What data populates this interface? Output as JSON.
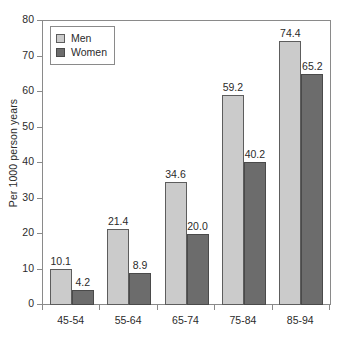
{
  "chart_data": {
    "type": "bar",
    "title": "",
    "xlabel": "",
    "ylabel": "Per 1000 person years",
    "categories": [
      "45-54",
      "55-64",
      "65-74",
      "75-84",
      "85-94"
    ],
    "series": [
      {
        "name": "Men",
        "values": [
          10.1,
          21.4,
          34.6,
          59.2,
          74.4
        ],
        "color": "#cbcbcb"
      },
      {
        "name": "Women",
        "values": [
          4.2,
          8.9,
          20.0,
          40.2,
          65.2
        ],
        "color": "#6c6c6c"
      }
    ],
    "value_labels": {
      "Men": [
        "10.1",
        "21.4",
        "34.6",
        "59.2",
        "74.4"
      ],
      "Women": [
        "4.2",
        "8.9",
        "20.0",
        "40.2",
        "65.2"
      ]
    },
    "ylim": [
      0,
      80
    ],
    "yticks": [
      0,
      10,
      20,
      30,
      40,
      50,
      60,
      70,
      80
    ],
    "ytick_labels": [
      "0",
      "10",
      "20",
      "30",
      "40",
      "50",
      "60",
      "70",
      "80"
    ],
    "grid": false,
    "legend_position": "top-left",
    "legend_entries": [
      "Men",
      "Women"
    ]
  }
}
